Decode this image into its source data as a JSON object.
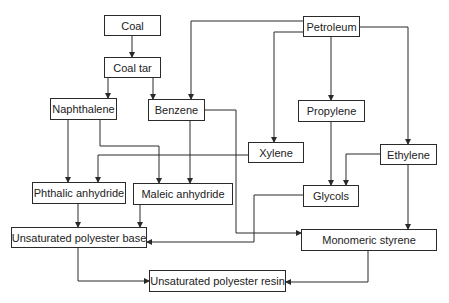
{
  "diagram": {
    "type": "flowchart",
    "title": "",
    "colors": {
      "stroke": "#2a2a2a",
      "text": "#222222",
      "background": "#ffffff"
    },
    "nodes": {
      "coal": {
        "label": "Coal",
        "x": 104,
        "y": 15,
        "w": 57,
        "h": 21
      },
      "coal_tar": {
        "label": "Coal tar",
        "x": 104,
        "y": 57,
        "w": 57,
        "h": 21
      },
      "naphthalene": {
        "label": "Naphthalene",
        "x": 50,
        "y": 98,
        "w": 67,
        "h": 22
      },
      "benzene": {
        "label": "Benzene",
        "x": 148,
        "y": 99,
        "w": 57,
        "h": 22
      },
      "petroleum": {
        "label": "Petroleum",
        "x": 303,
        "y": 16,
        "w": 57,
        "h": 21
      },
      "propylene": {
        "label": "Propylene",
        "x": 298,
        "y": 100,
        "w": 67,
        "h": 22
      },
      "xylene": {
        "label": "Xylene",
        "x": 248,
        "y": 142,
        "w": 56,
        "h": 21
      },
      "ethylene": {
        "label": "Ethylene",
        "x": 380,
        "y": 144,
        "w": 57,
        "h": 21
      },
      "phthalic_anhydride": {
        "label": "Phthalic anhydride",
        "x": 32,
        "y": 182,
        "w": 94,
        "h": 22
      },
      "maleic_anhydride": {
        "label": "Maleic anhydride",
        "x": 133,
        "y": 183,
        "w": 100,
        "h": 22
      },
      "glycols": {
        "label": "Glycols",
        "x": 303,
        "y": 185,
        "w": 56,
        "h": 22
      },
      "unsaturated_polyester_base": {
        "label": "Unsaturated polyester base",
        "x": 11,
        "y": 227,
        "w": 136,
        "h": 21
      },
      "monomeric_styrene": {
        "label": "Monomeric styrene",
        "x": 301,
        "y": 229,
        "w": 136,
        "h": 22
      },
      "unsaturated_polyester_resin": {
        "label": "Unsaturated polyester resin",
        "x": 149,
        "y": 270,
        "w": 137,
        "h": 22
      }
    },
    "edges": [
      {
        "from": "Coal",
        "to": "Coal tar"
      },
      {
        "from": "Coal tar",
        "to": "Naphthalene"
      },
      {
        "from": "Coal tar",
        "to": "Benzene"
      },
      {
        "from": "Petroleum",
        "to": "Benzene"
      },
      {
        "from": "Petroleum",
        "to": "Xylene"
      },
      {
        "from": "Petroleum",
        "to": "Propylene"
      },
      {
        "from": "Petroleum",
        "to": "Ethylene"
      },
      {
        "from": "Naphthalene",
        "to": "Phthalic anhydride"
      },
      {
        "from": "Naphthalene",
        "to": "Maleic anhydride"
      },
      {
        "from": "Benzene",
        "to": "Maleic anhydride"
      },
      {
        "from": "Benzene",
        "to": "Monomeric styrene"
      },
      {
        "from": "Xylene",
        "to": "Phthalic anhydride"
      },
      {
        "from": "Propylene",
        "to": "Glycols"
      },
      {
        "from": "Ethylene",
        "to": "Glycols"
      },
      {
        "from": "Ethylene",
        "to": "Monomeric styrene"
      },
      {
        "from": "Phthalic anhydride",
        "to": "Unsaturated polyester base"
      },
      {
        "from": "Maleic anhydride",
        "to": "Unsaturated polyester base"
      },
      {
        "from": "Glycols",
        "to": "Unsaturated polyester base"
      },
      {
        "from": "Unsaturated polyester base",
        "to": "Unsaturated polyester resin"
      },
      {
        "from": "Monomeric styrene",
        "to": "Unsaturated polyester resin"
      }
    ]
  }
}
